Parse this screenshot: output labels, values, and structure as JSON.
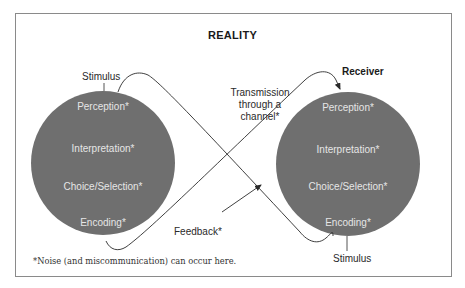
{
  "title": "REALITY",
  "left_circle": {
    "stages": [
      "Perception*",
      "Interpretation*",
      "Choice/Selection*",
      "Encoding*"
    ],
    "top_label": "Stimulus"
  },
  "right_circle": {
    "stages": [
      "Perception*",
      "Interpretation*",
      "Choice/Selection*",
      "Encoding*"
    ],
    "top_label": "Receiver",
    "bottom_label": "Stimulus"
  },
  "transmission_label": "Transmission through a channel*",
  "transmission_lines": [
    "Transmission",
    "through a",
    "channel*"
  ],
  "feedback_label": "Feedback*",
  "footnote": "*Noise (and miscommunication) can occur here.",
  "colors": {
    "circle_fill": "#6f6f6f",
    "circle_text": "#e6e6e6",
    "line": "#2a2a2a",
    "frame": "#8a8a8a"
  }
}
